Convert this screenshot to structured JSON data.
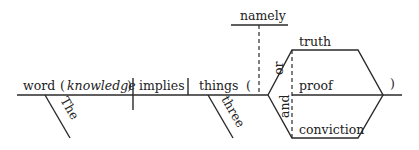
{
  "diagram": {
    "type": "sentence-diagram",
    "subject": {
      "word": "word",
      "appositive": "knowledge",
      "open_paren": "(",
      "close_paren": ")",
      "modifier": "The"
    },
    "verb": {
      "word": "implies"
    },
    "object": {
      "word": "things",
      "modifier": "three",
      "open_paren": "(",
      "close_paren": ")",
      "appositive_connector": "namely",
      "compound": {
        "items": [
          "truth",
          "proof",
          "conviction"
        ],
        "conjunction_1": "or",
        "conjunction_2": "and"
      }
    }
  }
}
